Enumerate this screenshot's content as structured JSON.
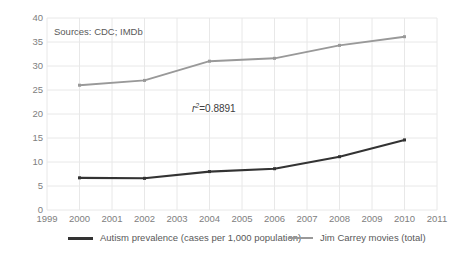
{
  "chart_data": {
    "type": "line",
    "title": "",
    "xlabel": "",
    "ylabel": "",
    "xlim": [
      1999,
      2011
    ],
    "ylim": [
      0,
      40
    ],
    "grid": true,
    "legend_position": "bottom",
    "x_ticks": [
      "1999",
      "2000",
      "2001",
      "2002",
      "2003",
      "2004",
      "2005",
      "2006",
      "2007",
      "2008",
      "2009",
      "2010",
      "2011"
    ],
    "y_ticks": [
      "0",
      "5",
      "10",
      "15",
      "20",
      "25",
      "30",
      "35",
      "40"
    ],
    "x": [
      2000,
      2002,
      2004,
      2006,
      2008,
      2010
    ],
    "series": [
      {
        "name": "Autism prevalence (cases per 1,000 population)",
        "color": "#333333",
        "values": [
          6.7,
          6.6,
          8.0,
          8.6,
          11.1,
          14.6
        ]
      },
      {
        "name": "Jim Carrey movies (total)",
        "color": "#999999",
        "values": [
          26.0,
          27.0,
          31.0,
          31.6,
          34.3,
          36.1
        ]
      }
    ],
    "annotations": [
      {
        "name": "sources",
        "text": "Sources: CDC; IMDb"
      },
      {
        "name": "r-squared",
        "prefix": "r",
        "superscript": "2",
        "suffix": "=0.8891"
      }
    ]
  },
  "colors": {
    "background": "#ffffff",
    "gridline": "#e8e8e8",
    "axis_text": "#808080",
    "annotation_text": "#595959",
    "series_dark": "#333333",
    "series_gray": "#999999"
  }
}
